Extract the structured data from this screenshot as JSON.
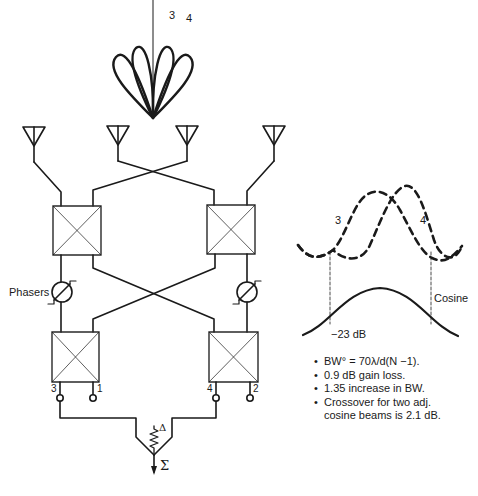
{
  "diagram": {
    "beam_pattern": {
      "lobe_labels": [
        "3",
        "4"
      ],
      "lobe_count": 4
    },
    "antennas": [
      {
        "id": "ant-1"
      },
      {
        "id": "ant-2"
      },
      {
        "id": "ant-3"
      },
      {
        "id": "ant-4"
      }
    ],
    "hybrids": [
      {
        "id": "hybrid-top-left"
      },
      {
        "id": "hybrid-top-right"
      },
      {
        "id": "hybrid-bottom-left"
      },
      {
        "id": "hybrid-bottom-right"
      }
    ],
    "phaser_label": "Phasers",
    "ports": {
      "p3": "3",
      "p1": "1",
      "p4": "4",
      "p2": "2"
    },
    "combiner": {
      "delta": "Δ",
      "sigma": "Σ"
    },
    "beam_plot": {
      "beam_labels": [
        "3",
        "4"
      ],
      "cosine_label": "Cosine",
      "level_label": "−23 dB"
    },
    "notes": [
      "BW° = 70λ/d(N −1).",
      "0.9 dB gain loss.",
      "1.35 increase in BW.",
      "Crossover for two adj.",
      "cosine beams is 2.1 dB."
    ],
    "colors": {
      "stroke": "#1a1a1a",
      "box_stroke": "#2a2a2a",
      "background": "#ffffff"
    }
  }
}
